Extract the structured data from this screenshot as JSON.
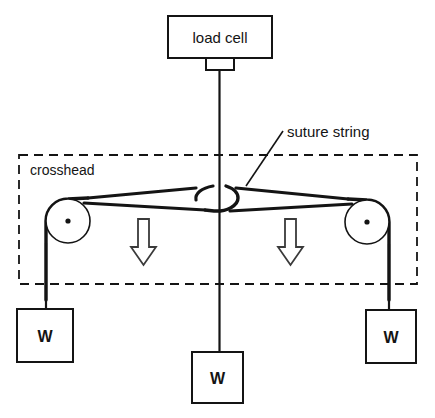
{
  "figure": {
    "kind": "mechanical-test-schematic",
    "background_color": "#ffffff",
    "line_color": "#141414",
    "width": 435,
    "height": 418
  },
  "labels": {
    "load_cell": "load cell",
    "suture_string": "suture string",
    "crosshead": "crosshead",
    "weight_left": "W",
    "weight_center": "W",
    "weight_right": "W"
  },
  "components": {
    "load_cell_box": {
      "x": 168,
      "y": 16,
      "width": 104,
      "height": 42
    },
    "load_cell_tab": {
      "x": 206,
      "y": 58,
      "width": 28,
      "height": 12
    },
    "crosshead_frame": {
      "x": 19,
      "y": 155,
      "width": 398,
      "height": 129
    },
    "pulley_left": {
      "cx": 68,
      "cy": 221,
      "r": 22
    },
    "pulley_right": {
      "cx": 367,
      "cy": 222,
      "r": 22
    },
    "arrow_left": {
      "x": 131,
      "y": 218,
      "width": 25,
      "height": 47
    },
    "arrow_right": {
      "x": 278,
      "y": 218,
      "width": 25,
      "height": 47
    },
    "weight_box_left": {
      "x": 17,
      "y": 309,
      "width": 56,
      "height": 53
    },
    "weight_box_center": {
      "x": 192,
      "y": 352,
      "width": 51,
      "height": 51
    },
    "weight_box_right": {
      "x": 366,
      "y": 310,
      "width": 50,
      "height": 53
    },
    "center_wire_x": 219,
    "knot_center": {
      "cx": 219,
      "cy": 196
    }
  },
  "annotations": {
    "arrow_direction": "down",
    "arrow_count": 2,
    "pulley_count": 2,
    "weight_count": 3
  }
}
